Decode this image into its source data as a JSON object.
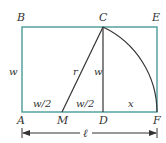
{
  "diagram": {
    "colors": {
      "rectangle": "#4a9a9a",
      "lines": "#333333",
      "labels": "#333333"
    },
    "points": {
      "A": {
        "label": "A",
        "x": 22,
        "y": 112
      },
      "B": {
        "label": "B",
        "x": 22,
        "y": 27
      },
      "C": {
        "label": "C",
        "x": 103,
        "y": 27
      },
      "D": {
        "label": "D",
        "x": 103,
        "y": 112
      },
      "E": {
        "label": "E",
        "x": 157,
        "y": 27
      },
      "F": {
        "label": "F",
        "x": 157,
        "y": 112
      },
      "M": {
        "label": "M",
        "x": 62,
        "y": 112
      }
    },
    "segment_labels": {
      "left_side": "w",
      "AM": "w/2",
      "MD": "w/2",
      "CD": "w",
      "MC": "r",
      "DF": "x",
      "total_length": "ℓ"
    }
  }
}
